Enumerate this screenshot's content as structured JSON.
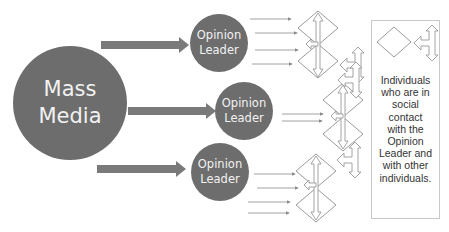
{
  "diagram": {
    "type": "two-step-flow-of-communication",
    "colors": {
      "circle_fill": "#6d6d6d",
      "big_arrow": "#7a7a7a",
      "thin_arrow": "#8a8a8a",
      "outline": "#9a9a9a",
      "text_light": "#f2f2f2",
      "text_dark": "#333333"
    },
    "source": {
      "label_line1": "Mass",
      "label_line2": "Media"
    },
    "opinion_leaders": [
      {
        "label_line1": "Opinion",
        "label_line2": "Leader",
        "outgoing_arrows": 4
      },
      {
        "label_line1": "Opinion",
        "label_line2": "Leader",
        "outgoing_arrows": 2
      },
      {
        "label_line1": "Opinion",
        "label_line2": "Leader",
        "outgoing_arrows": 4
      }
    ],
    "individual_icon": "diamond-icon",
    "interaction_icon": "t-double-arrow-icon",
    "legend": {
      "text": "Individuals\nwho are in\nsocial\ncontact\nwith the\nOpinion\nLeader and\nwith other\nindividuals."
    }
  }
}
